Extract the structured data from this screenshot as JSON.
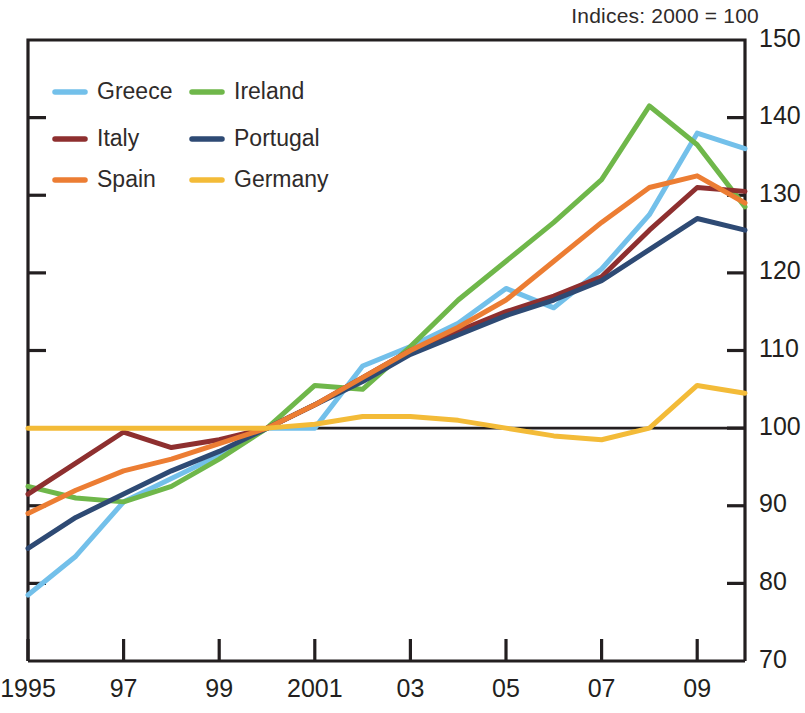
{
  "chart_note": "Indices:  2000 = 100",
  "legend": {
    "entries": [
      {
        "label": "Greece",
        "color": "#73c0ea",
        "key": "greece"
      },
      {
        "label": "Ireland",
        "color": "#6fb74a",
        "key": "ireland"
      },
      {
        "label": "Italy",
        "color": "#8e2f2f",
        "key": "italy"
      },
      {
        "label": "Portugal",
        "color": "#2e4a74",
        "key": "portugal"
      },
      {
        "label": "Spain",
        "color": "#ec7d33",
        "key": "spain"
      },
      {
        "label": "Germany",
        "color": "#f3bb38",
        "key": "germany"
      }
    ]
  },
  "chart_data": {
    "type": "line",
    "title": "Indices:  2000 = 100",
    "xlabel": "",
    "ylabel": "",
    "xlim": [
      1995,
      2010
    ],
    "ylim": [
      70,
      150
    ],
    "ytick_values": [
      70,
      80,
      90,
      100,
      110,
      120,
      130,
      140,
      150
    ],
    "ytick_labels": [
      "70",
      "80",
      "90",
      "100",
      "110",
      "120",
      "130",
      "140",
      "150"
    ],
    "xtick_values": [
      1995,
      1997,
      1999,
      2001,
      2003,
      2005,
      2007,
      2009
    ],
    "xtick_labels": [
      "1995",
      "97",
      "99",
      "2001",
      "03",
      "05",
      "07",
      "09"
    ],
    "x": [
      1995,
      1996,
      1997,
      1998,
      1999,
      2000,
      2001,
      2002,
      2003,
      2004,
      2005,
      2006,
      2007,
      2008,
      2009,
      2010
    ],
    "grid": false,
    "reference_line": 100,
    "legend_position": "top-left",
    "y_axis_side": "both",
    "series": [
      {
        "name": "Greece",
        "color": "#73c0ea",
        "values": [
          78.5,
          83.5,
          90.5,
          93.5,
          96.5,
          100.0,
          100.0,
          108.0,
          110.5,
          113.5,
          118.0,
          115.5,
          120.5,
          127.5,
          138.0,
          136.0
        ]
      },
      {
        "name": "Ireland",
        "color": "#6fb74a",
        "values": [
          92.5,
          91.0,
          90.5,
          92.5,
          96.0,
          100.0,
          105.5,
          105.0,
          110.5,
          116.5,
          121.5,
          126.5,
          132.0,
          141.5,
          136.5,
          128.5
        ]
      },
      {
        "name": "Italy",
        "color": "#8e2f2f",
        "values": [
          91.5,
          95.5,
          99.5,
          97.5,
          98.5,
          100.0,
          103.0,
          106.5,
          110.0,
          112.5,
          115.0,
          117.0,
          119.5,
          125.5,
          131.0,
          130.5
        ]
      },
      {
        "name": "Portugal",
        "color": "#2e4a74",
        "values": [
          84.5,
          88.5,
          91.5,
          94.5,
          97.0,
          100.0,
          103.0,
          106.0,
          109.5,
          112.0,
          114.5,
          116.5,
          119.0,
          123.0,
          127.0,
          125.5
        ]
      },
      {
        "name": "Spain",
        "color": "#ec7d33",
        "values": [
          89.0,
          92.0,
          94.5,
          96.0,
          98.0,
          100.0,
          103.0,
          106.5,
          110.0,
          113.0,
          116.5,
          121.5,
          126.5,
          131.0,
          132.5,
          129.0
        ]
      },
      {
        "name": "Germany",
        "color": "#f3bb38",
        "values": [
          100.0,
          100.0,
          100.0,
          100.0,
          100.0,
          100.0,
          100.5,
          101.5,
          101.5,
          101.0,
          100.0,
          99.0,
          98.5,
          100.0,
          105.5,
          104.5
        ]
      }
    ]
  }
}
